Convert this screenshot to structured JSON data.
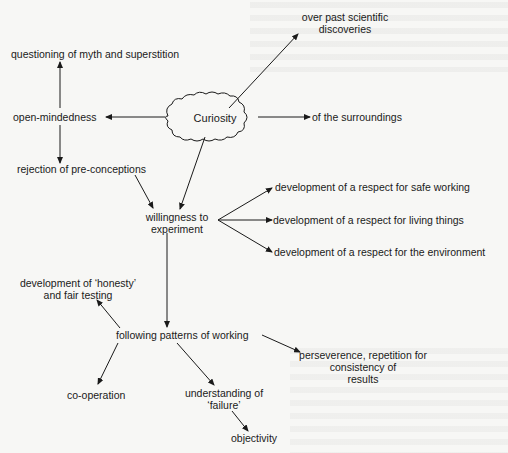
{
  "diagram": {
    "central_node": "Curiosity",
    "nodes": {
      "questioning": "questioning of myth and superstition",
      "open_mindedness": "open-mindedness",
      "rejection": "rejection of pre-conceptions",
      "past_discoveries_line1": "over past scientific",
      "past_discoveries_line2": "discoveries",
      "surroundings": "of the surroundings",
      "willingness_line1": "willingness to",
      "willingness_line2": "experiment",
      "safe_working": "development of a respect for safe working",
      "living_things": "development of a respect for living things",
      "environment": "development of a respect for the environment",
      "honesty_line1": "development of ‘honesty’",
      "honesty_line2": "and fair testing",
      "patterns": "following patterns of working",
      "perseverence_line1": "perseverence, repetition for",
      "perseverence_line2": "consistency of",
      "perseverence_line3": "results",
      "cooperation": "co-operation",
      "failure_line1": "understanding of",
      "failure_line2": "‘failure’",
      "objectivity": "objectivity"
    },
    "edges": [
      [
        "Curiosity",
        "open-mindedness"
      ],
      [
        "Curiosity",
        "over past scientific discoveries"
      ],
      [
        "Curiosity",
        "of the surroundings"
      ],
      [
        "Curiosity",
        "willingness to experiment"
      ],
      [
        "open-mindedness",
        "questioning of myth and superstition"
      ],
      [
        "open-mindedness",
        "rejection of pre-conceptions"
      ],
      [
        "rejection of pre-conceptions",
        "willingness to experiment"
      ],
      [
        "willingness to experiment",
        "development of a respect for safe working"
      ],
      [
        "willingness to experiment",
        "development of a respect for living things"
      ],
      [
        "willingness to experiment",
        "development of a respect for the environment"
      ],
      [
        "willingness to experiment",
        "following patterns of working"
      ],
      [
        "following patterns of working",
        "development of ‘honesty’ and fair testing"
      ],
      [
        "following patterns of working",
        "perseverence, repetition for consistency of results"
      ],
      [
        "following patterns of working",
        "co-operation"
      ],
      [
        "following patterns of working",
        "understanding of ‘failure’"
      ],
      [
        "understanding of ‘failure’",
        "objectivity"
      ]
    ],
    "colors": {
      "ink": "#1a1a1a",
      "paper": "#f7f7f5"
    }
  }
}
